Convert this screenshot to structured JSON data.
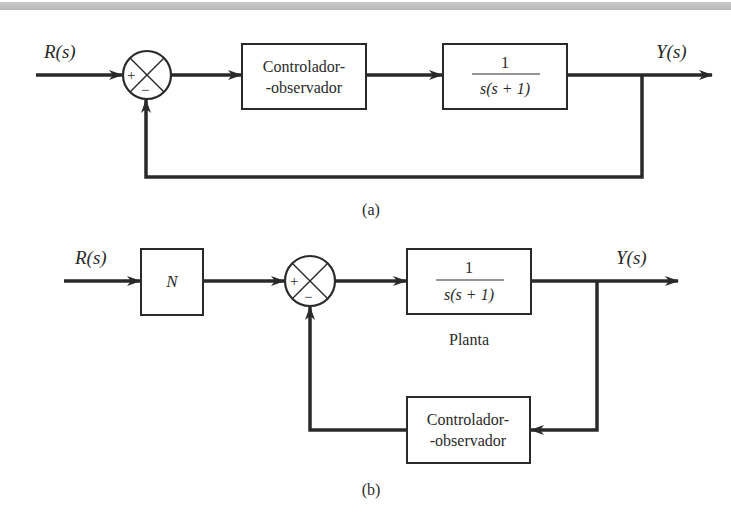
{
  "diagram_a": {
    "input_label": "R(s)",
    "output_label": "Y(s)",
    "sum_plus": "+",
    "sum_minus": "−",
    "controller": {
      "line1": "Controlador-",
      "line2": "-observador"
    },
    "plant": {
      "numerator": "1",
      "denominator": "s(s + 1)"
    },
    "caption": "(a)"
  },
  "diagram_b": {
    "input_label": "R(s)",
    "output_label": "Y(s)",
    "gain_block": "N",
    "sum_plus": "+",
    "sum_minus": "−",
    "plant": {
      "numerator": "1",
      "denominator": "s(s + 1)",
      "label": "Planta"
    },
    "controller": {
      "line1": "Controlador-",
      "line2": "-observador"
    },
    "caption": "(b)"
  },
  "colors": {
    "line": "#2a2a2a",
    "top_band": "#c0c0c0",
    "background": "#ffffff"
  }
}
